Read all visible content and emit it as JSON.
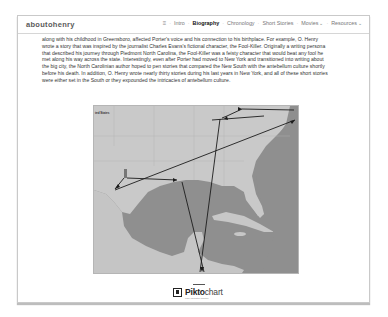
{
  "header": {
    "brand": "aboutohenry",
    "nav": [
      {
        "label": "≡",
        "icon": "menu-icon",
        "active": false
      },
      {
        "label": "Intro",
        "active": false
      },
      {
        "label": "Biography",
        "active": true
      },
      {
        "label": "Chronology",
        "active": false
      },
      {
        "label": "Short Stories",
        "active": false
      },
      {
        "label": "Movies",
        "dropdown": true,
        "active": false
      },
      {
        "label": "Resources",
        "dropdown": true,
        "active": false
      }
    ],
    "separator": "·",
    "chevron": "⌄"
  },
  "article": {
    "lines": [
      "along with his childhood in Greensboro, affected Porter's voice and his connection to his birthplace. For example, O. Henry",
      "wrote a story that was inspired by the journalist Charles Evans's fictional character, the Fool-Killer. Originally a writing persona",
      "that described his journey through Piedmont North Carolina, the Fool-Killer was a feisty character that would beat any fool he",
      "met along his way across the state. Interestingly, even after Porter had moved to New York and transitioned into writing about",
      "the big city, the North Carolinian author hoped to pen stories that compared the New South with the antebellum culture shortly",
      "before his death. In addition, O. Henry wrote nearly thirty stories during his last years in New York, and all of these short stories",
      "were either set in the South or they expounded the intricacies of antebellum culture."
    ]
  },
  "map": {
    "label_top_left": "ted States",
    "colors": {
      "land": "#c8c8c8",
      "water": "#8f8f8f",
      "route": "#1c1c1c"
    }
  },
  "footer_logo": {
    "brand_bold": "Pikto",
    "brand_light": "chart",
    "tagline": "make information beautiful"
  }
}
